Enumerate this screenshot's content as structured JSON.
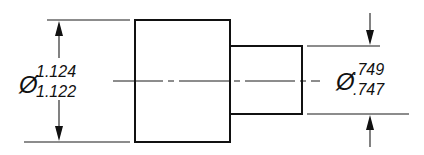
{
  "drawing": {
    "type": "stepped shaft / pin, dimensioned side view",
    "large_diameter": {
      "symbol": "Ø",
      "upper_limit": "1.124",
      "lower_limit": "1.122"
    },
    "small_diameter": {
      "symbol": "Ø",
      "upper_limit": ".749",
      "lower_limit": ".747"
    },
    "line_color": "#111111",
    "background_color": "#ffffff"
  }
}
